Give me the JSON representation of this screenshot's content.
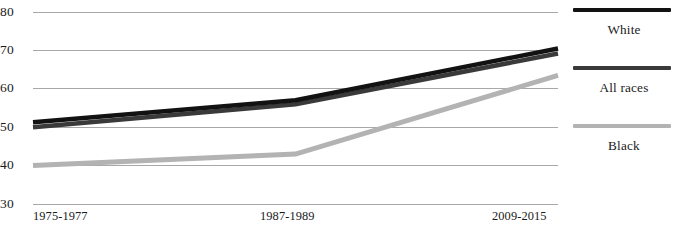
{
  "chart_data": {
    "type": "line",
    "title": "",
    "subtitle": "",
    "xlabel": "",
    "ylabel": "",
    "categories": [
      "1975-1977",
      "1987-1989",
      "2009-2015"
    ],
    "x": [
      0,
      1,
      2
    ],
    "xlim": [
      0,
      2
    ],
    "ylim": [
      30,
      80
    ],
    "y_ticks": [
      80,
      70,
      60,
      50,
      40,
      30
    ],
    "grid": "horizontal",
    "legend_position": "right",
    "series": [
      {
        "name": "White",
        "color": "#121212",
        "values": [
          51.3,
          57.0,
          70.5
        ]
      },
      {
        "name": "All races",
        "color": "#3a3a3a",
        "values": [
          50.0,
          56.0,
          69.2
        ]
      },
      {
        "name": "Black",
        "color": "#b3b3b3",
        "values": [
          40.0,
          43.0,
          63.5
        ]
      }
    ],
    "annotations": []
  },
  "axes": {
    "y_tick_labels": [
      "80",
      "70",
      "60",
      "50",
      "40",
      "30"
    ],
    "x_tick_labels": [
      "1975-1977",
      "1987-1989",
      "2009-2015"
    ]
  },
  "legend": {
    "entries": [
      {
        "label": "White",
        "color": "#121212",
        "thickness": 4
      },
      {
        "label": "All races",
        "color": "#3a3a3a",
        "thickness": 4
      },
      {
        "label": "Black",
        "color": "#b3b3b3",
        "thickness": 4
      }
    ]
  },
  "caption": {
    "partial_text": ""
  }
}
